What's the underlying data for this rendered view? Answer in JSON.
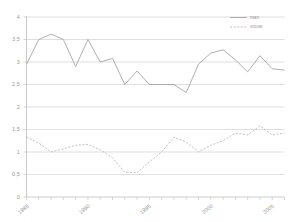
{
  "chart_data": {
    "type": "line",
    "title": "",
    "xlabel": "",
    "ylabel": "",
    "ylim": [
      0,
      4
    ],
    "xlim": [
      1985,
      2006
    ],
    "grid": true,
    "legend_position": "top-right",
    "ytick_labels": [
      "0",
      "0,5",
      "1",
      "1,5",
      "2",
      "2,5",
      "3",
      "3,5",
      "4"
    ],
    "ytick_values": [
      0,
      0.5,
      1,
      1.5,
      2,
      2.5,
      3,
      3.5,
      4
    ],
    "xtick_labels": [
      "1985",
      "1990",
      "1995",
      "2000",
      "2005"
    ],
    "xtick_values": [
      1985,
      1990,
      1995,
      2000,
      2005
    ],
    "x": [
      1985,
      1986,
      1987,
      1988,
      1989,
      1990,
      1991,
      1992,
      1993,
      1994,
      1995,
      1996,
      1997,
      1998,
      1999,
      2000,
      2001,
      2002,
      2003,
      2004,
      2005,
      2006
    ],
    "series": [
      {
        "name": "man",
        "style": "solid",
        "color": "#9a9a9a",
        "values": [
          2.95,
          3.5,
          3.62,
          3.5,
          2.9,
          3.5,
          3.0,
          3.08,
          2.5,
          2.8,
          2.5,
          2.5,
          2.5,
          2.32,
          2.95,
          3.2,
          3.27,
          3.05,
          2.78,
          3.14,
          2.85,
          2.82
        ]
      },
      {
        "name": "vrouw",
        "style": "dashed",
        "color": "#b0b0b0",
        "values": [
          1.33,
          1.2,
          1.0,
          1.07,
          1.15,
          1.17,
          1.05,
          0.87,
          0.55,
          0.54,
          0.78,
          1.0,
          1.33,
          1.22,
          1.0,
          1.15,
          1.25,
          1.42,
          1.38,
          1.58,
          1.38,
          1.42
        ]
      }
    ]
  },
  "legend": {
    "entries": [
      {
        "label": "man",
        "style": "solid"
      },
      {
        "label": "vrouw",
        "style": "dashed"
      }
    ]
  }
}
